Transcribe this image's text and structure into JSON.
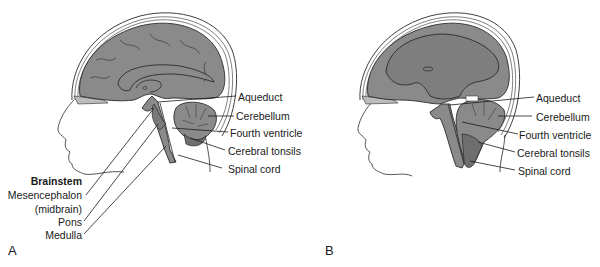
{
  "figure": {
    "colors": {
      "brain_fill": "#8a8a8a",
      "brain_dark": "#6e6e6e",
      "outline": "#2a2a2a",
      "skull": "#ffffff",
      "background": "#ffffff",
      "text": "#1a1a1a"
    },
    "panels": [
      {
        "letter": "A",
        "description": "Normal brain, sagittal section",
        "labels_right": [
          "Aqueduct",
          "Cerebellum",
          "Fourth ventricle",
          "Cerebral tonsils",
          "Spinal cord"
        ],
        "brainstem_group": {
          "title": "Brainstem",
          "items": [
            "Mesencephalon",
            "(midbrain)",
            "Pons",
            "Medulla"
          ]
        }
      },
      {
        "letter": "B",
        "description": "Brain with herniated cerebellar tonsils, sagittal section",
        "labels_right": [
          "Aqueduct",
          "Cerebellum",
          "Fourth ventricle",
          "Cerebral tonsils",
          "Spinal cord"
        ]
      }
    ]
  }
}
